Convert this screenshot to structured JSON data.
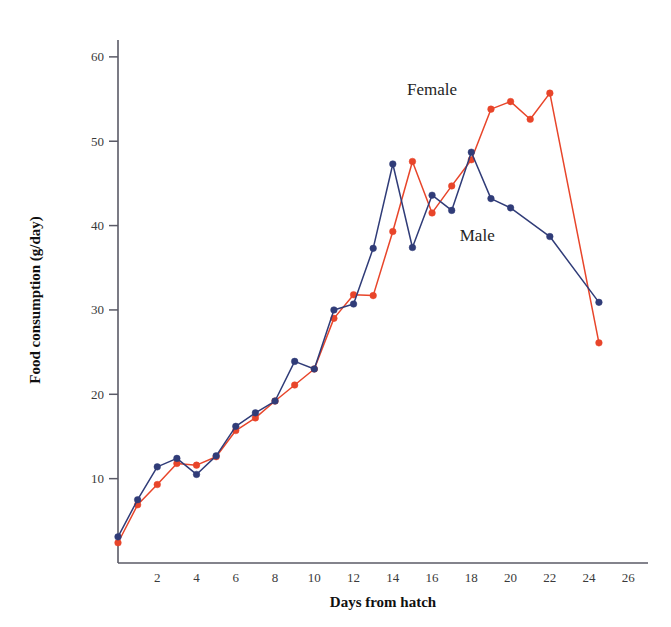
{
  "chart_data": {
    "type": "line",
    "title": "",
    "xlabel": "Days from hatch",
    "ylabel": "Food consumption (g/day)",
    "xlim": [
      0,
      27
    ],
    "ylim": [
      0,
      62
    ],
    "xticks": [
      2,
      4,
      6,
      8,
      10,
      12,
      14,
      16,
      18,
      20,
      22,
      24,
      26
    ],
    "yticks": [
      10,
      20,
      30,
      40,
      50,
      60
    ],
    "grid": false,
    "legend_position": "inline-annotations",
    "series": [
      {
        "name": "Female",
        "color": "#E8452A",
        "marker": "circle",
        "label_x": 16.0,
        "label_y": 55.5,
        "points": [
          {
            "x": 0.0,
            "y": 2.4
          },
          {
            "x": 1.0,
            "y": 6.9
          },
          {
            "x": 2.0,
            "y": 9.3
          },
          {
            "x": 3.0,
            "y": 11.8
          },
          {
            "x": 4.0,
            "y": 11.6
          },
          {
            "x": 5.0,
            "y": 12.6
          },
          {
            "x": 6.0,
            "y": 15.7
          },
          {
            "x": 7.0,
            "y": 17.2
          },
          {
            "x": 8.0,
            "y": 19.2
          },
          {
            "x": 9.0,
            "y": 21.1
          },
          {
            "x": 10.0,
            "y": 23.0
          },
          {
            "x": 11.0,
            "y": 29.0
          },
          {
            "x": 12.0,
            "y": 31.8
          },
          {
            "x": 13.0,
            "y": 31.7
          },
          {
            "x": 14.0,
            "y": 39.3
          },
          {
            "x": 15.0,
            "y": 47.6
          },
          {
            "x": 16.0,
            "y": 41.5
          },
          {
            "x": 17.0,
            "y": 44.7
          },
          {
            "x": 18.0,
            "y": 47.8
          },
          {
            "x": 19.0,
            "y": 53.8
          },
          {
            "x": 20.0,
            "y": 54.7
          },
          {
            "x": 21.0,
            "y": 52.6
          },
          {
            "x": 22.0,
            "y": 55.7
          },
          {
            "x": 24.5,
            "y": 26.1
          }
        ]
      },
      {
        "name": "Male",
        "color": "#303C78",
        "marker": "circle",
        "label_x": 18.3,
        "label_y": 38.2,
        "points": [
          {
            "x": 0.0,
            "y": 3.1
          },
          {
            "x": 1.0,
            "y": 7.5
          },
          {
            "x": 2.0,
            "y": 11.4
          },
          {
            "x": 3.0,
            "y": 12.4
          },
          {
            "x": 4.0,
            "y": 10.5
          },
          {
            "x": 5.0,
            "y": 12.7
          },
          {
            "x": 6.0,
            "y": 16.2
          },
          {
            "x": 7.0,
            "y": 17.8
          },
          {
            "x": 8.0,
            "y": 19.2
          },
          {
            "x": 9.0,
            "y": 23.9
          },
          {
            "x": 10.0,
            "y": 23.0
          },
          {
            "x": 11.0,
            "y": 30.0
          },
          {
            "x": 12.0,
            "y": 30.7
          },
          {
            "x": 13.0,
            "y": 37.3
          },
          {
            "x": 14.0,
            "y": 47.3
          },
          {
            "x": 15.0,
            "y": 37.4
          },
          {
            "x": 16.0,
            "y": 43.6
          },
          {
            "x": 17.0,
            "y": 41.8
          },
          {
            "x": 18.0,
            "y": 48.7
          },
          {
            "x": 19.0,
            "y": 43.2
          },
          {
            "x": 20.0,
            "y": 42.1
          },
          {
            "x": 22.0,
            "y": 38.7
          },
          {
            "x": 24.5,
            "y": 30.9
          }
        ]
      }
    ]
  }
}
